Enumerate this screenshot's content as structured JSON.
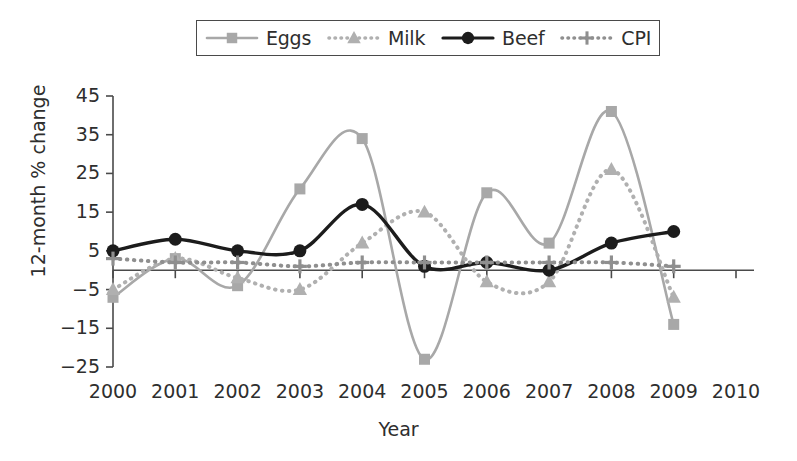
{
  "legend": {
    "entries": [
      {
        "label": "Eggs",
        "key": "eggs",
        "color": "#a8a8a8",
        "marker": "square",
        "line": "solid"
      },
      {
        "label": "Milk",
        "key": "milk",
        "color": "#b0b0b0",
        "marker": "triangle",
        "line": "dotted"
      },
      {
        "label": "Beef",
        "key": "beef",
        "color": "#1c1c1c",
        "marker": "circle",
        "line": "solid"
      },
      {
        "label": "CPI",
        "key": "cpi",
        "color": "#8f8f8f",
        "marker": "plus",
        "line": "dotted"
      }
    ]
  },
  "axes": {
    "ylabel": "12-month % change",
    "xlabel": "Year",
    "yticks": [
      "45",
      "35",
      "25",
      "15",
      "5",
      "−5",
      "−15",
      "−25"
    ],
    "xticks": [
      "2000",
      "2001",
      "2002",
      "2003",
      "2004",
      "2005",
      "2006",
      "2007",
      "2008",
      "2009",
      "2010"
    ]
  },
  "chart_data": {
    "type": "line",
    "title": "",
    "xlabel": "Year",
    "ylabel": "12-month % change",
    "x": [
      2000,
      2001,
      2002,
      2003,
      2004,
      2005,
      2006,
      2007,
      2008,
      2009
    ],
    "xlim": [
      2000,
      2010
    ],
    "ylim": [
      -25,
      45
    ],
    "yticks": [
      -25,
      -15,
      -5,
      5,
      15,
      25,
      35,
      45
    ],
    "xticks": [
      2000,
      2001,
      2002,
      2003,
      2004,
      2005,
      2006,
      2007,
      2008,
      2009,
      2010
    ],
    "grid": false,
    "legend_position": "top",
    "smoothing": "spline",
    "series": [
      {
        "name": "Eggs",
        "color": "#a8a8a8",
        "marker": "square",
        "linestyle": "solid",
        "values": [
          -7,
          3,
          -4,
          21,
          34,
          -23,
          20,
          7,
          41,
          -14
        ]
      },
      {
        "name": "Milk",
        "color": "#b0b0b0",
        "marker": "triangle",
        "linestyle": "dotted",
        "values": [
          -5,
          3,
          -2,
          -5,
          7,
          15,
          -3,
          -3,
          26,
          -7
        ]
      },
      {
        "name": "Beef",
        "color": "#1c1c1c",
        "marker": "circle",
        "linestyle": "solid",
        "values": [
          5,
          8,
          5,
          5,
          17,
          1,
          2,
          0,
          7,
          10
        ]
      },
      {
        "name": "CPI",
        "color": "#8f8f8f",
        "marker": "plus",
        "linestyle": "dotted",
        "values": [
          3,
          2,
          2,
          1,
          2,
          2,
          2,
          2,
          2,
          1
        ]
      }
    ]
  }
}
